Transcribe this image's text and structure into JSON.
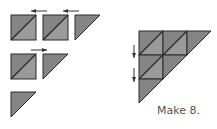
{
  "caption": "Make 8.",
  "colors": {
    "fill_dark": "#858585",
    "fill_light": "#9a9a9a",
    "stroke": "#2a2a2a",
    "arrow": "#333333",
    "caption": "#555555"
  },
  "pieces": [
    {
      "type": "square",
      "x": 11,
      "y": 15,
      "size": 25
    },
    {
      "type": "square",
      "x": 43,
      "y": 15,
      "size": 25
    },
    {
      "type": "triangle",
      "x": 75,
      "y": 15,
      "size": 25
    },
    {
      "type": "square",
      "x": 11,
      "y": 54,
      "size": 25
    },
    {
      "type": "triangle",
      "x": 43,
      "y": 54,
      "size": 25
    },
    {
      "type": "triangle",
      "x": 11,
      "y": 92,
      "size": 25
    }
  ],
  "arrows": [
    {
      "direction": "left",
      "x1": 47,
      "y1": 11,
      "x2": 31,
      "y2": 11
    },
    {
      "direction": "left",
      "x1": 79,
      "y1": 11,
      "x2": 63,
      "y2": 11
    },
    {
      "direction": "right",
      "x1": 31,
      "y1": 50,
      "x2": 47,
      "y2": 50
    },
    {
      "direction": "down",
      "x1": 134,
      "y1": 45,
      "x2": 134,
      "y2": 58
    },
    {
      "direction": "down",
      "x1": 134,
      "y1": 68,
      "x2": 134,
      "y2": 82
    }
  ],
  "assembled": {
    "x": 139,
    "y": 31,
    "cell": 24,
    "rows": 3
  }
}
